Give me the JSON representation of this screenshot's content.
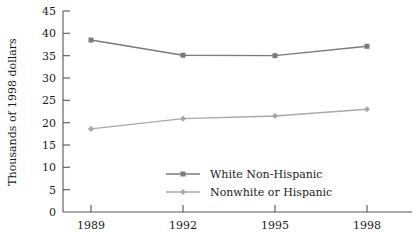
{
  "chart_data": {
    "type": "line",
    "title": "",
    "xlabel": "",
    "ylabel": "Thousands of 1998 dollars",
    "categories": [
      "1989",
      "1992",
      "1995",
      "1998"
    ],
    "x": [
      1989,
      1992,
      1995,
      1998
    ],
    "xlim": [
      1987.5,
      1999.5
    ],
    "ylim": [
      0,
      45
    ],
    "yticks": [
      "0",
      "5",
      "10",
      "15",
      "20",
      "25",
      "30",
      "35",
      "40",
      "45"
    ],
    "ytick_values": [
      0,
      5,
      10,
      15,
      20,
      25,
      30,
      35,
      40,
      45
    ],
    "grid": false,
    "legend_position": "center",
    "series": [
      {
        "name": "White Non-Hispanic",
        "values": [
          38.5,
          35.1,
          35.0,
          37.1
        ],
        "color": "#7a7a7a",
        "marker": "square"
      },
      {
        "name": "Nonwhite or Hispanic",
        "values": [
          18.6,
          20.9,
          21.5,
          23.0
        ],
        "color": "#a8a8a8",
        "marker": "diamond"
      }
    ]
  },
  "colors": {
    "axis": "#555555",
    "text": "#1a1a1a",
    "series_white_non_hispanic": "#7a7a7a",
    "series_nonwhite_or_hispanic": "#a8a8a8",
    "background": "#ffffff"
  },
  "legend": {
    "items": [
      {
        "label": "White Non-Hispanic"
      },
      {
        "label": "Nonwhite or Hispanic"
      }
    ]
  }
}
